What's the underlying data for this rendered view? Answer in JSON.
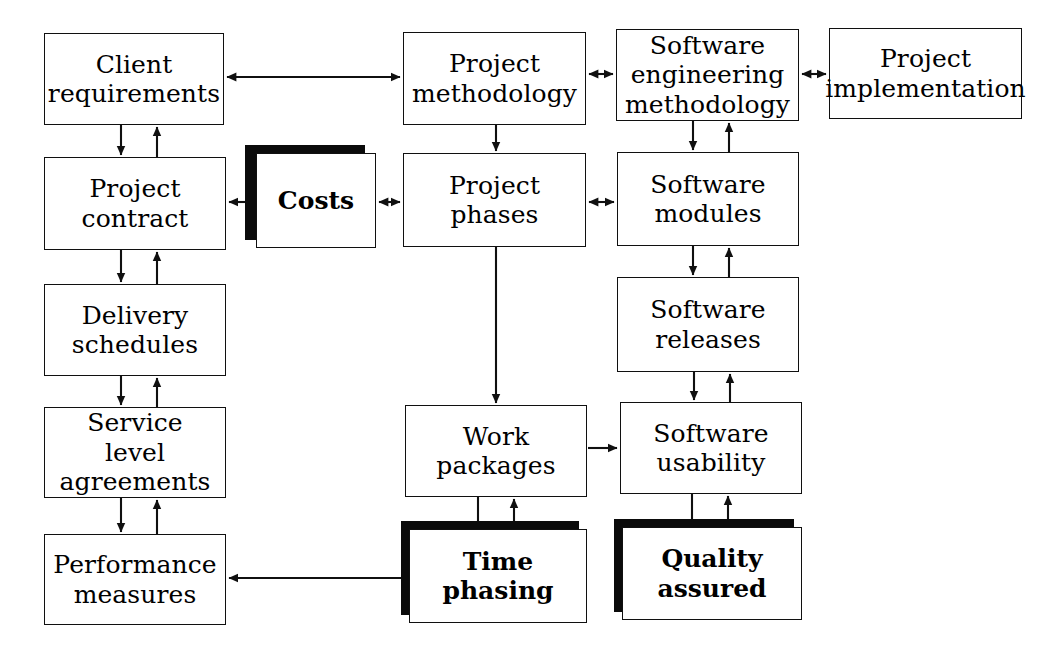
{
  "diagram": {
    "canvas": {
      "width": 1054,
      "height": 656,
      "background": "#ffffff"
    },
    "line_color": "#101010",
    "shadow_color": "#0b0b0b",
    "nodes": [
      {
        "id": "client-requirements",
        "label": "Client\nrequirements",
        "style": "plain",
        "x": 44,
        "y": 33,
        "w": 180,
        "h": 92
      },
      {
        "id": "project-methodology",
        "label": "Project\nmethodology",
        "style": "plain",
        "x": 403,
        "y": 32,
        "w": 183,
        "h": 93
      },
      {
        "id": "software-eng-method",
        "label": "Software\nengineering\nmethodology",
        "style": "plain",
        "x": 616,
        "y": 29,
        "w": 183,
        "h": 92
      },
      {
        "id": "project-implementation",
        "label": "Project\nimplementation",
        "style": "plain",
        "x": 829,
        "y": 28,
        "w": 193,
        "h": 91
      },
      {
        "id": "project-contract",
        "label": "Project\ncontract",
        "style": "plain",
        "x": 44,
        "y": 157,
        "w": 182,
        "h": 93
      },
      {
        "id": "costs",
        "label": "Costs",
        "style": "shadowed",
        "x": 256,
        "y": 153,
        "w": 120,
        "h": 95
      },
      {
        "id": "project-phases",
        "label": "Project\nphases",
        "style": "plain",
        "x": 403,
        "y": 153,
        "w": 183,
        "h": 94
      },
      {
        "id": "software-modules",
        "label": "Software\nmodules",
        "style": "plain",
        "x": 617,
        "y": 152,
        "w": 182,
        "h": 94
      },
      {
        "id": "delivery-schedules",
        "label": "Delivery\nschedules",
        "style": "plain",
        "x": 44,
        "y": 284,
        "w": 182,
        "h": 92
      },
      {
        "id": "software-releases",
        "label": "Software\nreleases",
        "style": "plain",
        "x": 617,
        "y": 277,
        "w": 182,
        "h": 95
      },
      {
        "id": "service-level",
        "label": "Service\nlevel\nagreements",
        "style": "plain",
        "x": 44,
        "y": 407,
        "w": 182,
        "h": 91
      },
      {
        "id": "work-packages",
        "label": "Work\npackages",
        "style": "plain",
        "x": 405,
        "y": 405,
        "w": 182,
        "h": 92
      },
      {
        "id": "software-usability",
        "label": "Software\nusability",
        "style": "plain",
        "x": 620,
        "y": 402,
        "w": 182,
        "h": 92
      },
      {
        "id": "performance-measures",
        "label": "Performance\nmeasures",
        "style": "plain",
        "x": 44,
        "y": 534,
        "w": 182,
        "h": 91
      },
      {
        "id": "time-phasing",
        "label": "Time\nphasing",
        "style": "shadowed",
        "x": 409,
        "y": 529,
        "w": 178,
        "h": 94
      },
      {
        "id": "quality-assured",
        "label": "Quality\nassured",
        "style": "shadowed",
        "x": 622,
        "y": 527,
        "w": 180,
        "h": 93
      }
    ],
    "edges": [
      {
        "id": "client-requirements--project-methodology",
        "from": "client-requirements",
        "to": "project-methodology",
        "arrows": "both"
      },
      {
        "id": "project-methodology--software-eng-method",
        "from": "project-methodology",
        "to": "software-eng-method",
        "arrows": "both"
      },
      {
        "id": "software-eng-method--project-implementation",
        "from": "software-eng-method",
        "to": "project-implementation",
        "arrows": "both"
      },
      {
        "id": "client-requirements--project-contract-down",
        "from": "client-requirements",
        "to": "project-contract",
        "arrows": "end"
      },
      {
        "id": "project-contract--client-requirements-up",
        "from": "project-contract",
        "to": "client-requirements",
        "arrows": "end"
      },
      {
        "id": "project-contract--delivery-schedules-down",
        "from": "project-contract",
        "to": "delivery-schedules",
        "arrows": "end"
      },
      {
        "id": "delivery-schedules--project-contract-up",
        "from": "delivery-schedules",
        "to": "project-contract",
        "arrows": "end"
      },
      {
        "id": "delivery-schedules--service-level-down",
        "from": "delivery-schedules",
        "to": "service-level",
        "arrows": "end"
      },
      {
        "id": "service-level--delivery-schedules-up",
        "from": "service-level",
        "to": "delivery-schedules",
        "arrows": "end"
      },
      {
        "id": "service-level--performance-measures-down",
        "from": "service-level",
        "to": "performance-measures",
        "arrows": "end"
      },
      {
        "id": "performance-measures--service-level-up",
        "from": "performance-measures",
        "to": "service-level",
        "arrows": "end"
      },
      {
        "id": "costs--project-contract",
        "from": "costs",
        "to": "project-contract",
        "arrows": "end"
      },
      {
        "id": "costs--project-phases",
        "from": "costs",
        "to": "project-phases",
        "arrows": "both"
      },
      {
        "id": "project-methodology--project-phases",
        "from": "project-methodology",
        "to": "project-phases",
        "arrows": "end"
      },
      {
        "id": "project-phases--software-modules",
        "from": "project-phases",
        "to": "software-modules",
        "arrows": "both"
      },
      {
        "id": "software-eng-method--software-modules-down",
        "from": "software-eng-method",
        "to": "software-modules",
        "arrows": "end"
      },
      {
        "id": "software-modules--software-eng-method-up",
        "from": "software-modules",
        "to": "software-eng-method",
        "arrows": "end"
      },
      {
        "id": "software-modules--software-releases-down",
        "from": "software-modules",
        "to": "software-releases",
        "arrows": "end"
      },
      {
        "id": "software-releases--software-modules-up",
        "from": "software-releases",
        "to": "software-modules",
        "arrows": "end"
      },
      {
        "id": "software-releases--software-usability-down",
        "from": "software-releases",
        "to": "software-usability",
        "arrows": "end"
      },
      {
        "id": "software-usability--software-releases-up",
        "from": "software-usability",
        "to": "software-releases",
        "arrows": "end"
      },
      {
        "id": "project-phases--work-packages",
        "from": "project-phases",
        "to": "work-packages",
        "arrows": "end"
      },
      {
        "id": "work-packages--software-usability",
        "from": "work-packages",
        "to": "software-usability",
        "arrows": "end"
      },
      {
        "id": "work-packages--time-phasing-down",
        "from": "work-packages",
        "to": "time-phasing",
        "arrows": "none"
      },
      {
        "id": "time-phasing--work-packages-up",
        "from": "time-phasing",
        "to": "work-packages",
        "arrows": "end"
      },
      {
        "id": "software-usability--quality-assured-down",
        "from": "software-usability",
        "to": "quality-assured",
        "arrows": "none"
      },
      {
        "id": "quality-assured--software-usability-up",
        "from": "quality-assured",
        "to": "software-usability",
        "arrows": "end"
      },
      {
        "id": "time-phasing--performance-measures",
        "from": "time-phasing",
        "to": "performance-measures",
        "arrows": "end"
      }
    ]
  }
}
